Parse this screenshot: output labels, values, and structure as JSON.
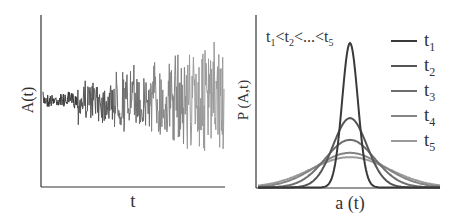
{
  "chart_data": [
    {
      "type": "line",
      "title": "",
      "xlabel": "t",
      "ylabel": "A(t)",
      "grid": false,
      "description": "Noisy time series whose amplitude grows with t; color lightens from dark gray to light gray over time",
      "segments": [
        {
          "name": "t1",
          "x_range": [
            0,
            0.19
          ],
          "amplitude": 0.1,
          "color": "#3a3a3a"
        },
        {
          "name": "t2",
          "x_range": [
            0.19,
            0.39
          ],
          "amplitude": 0.3,
          "color": "#555555"
        },
        {
          "name": "t3",
          "x_range": [
            0.39,
            0.59
          ],
          "amplitude": 0.45,
          "color": "#6e6e6e"
        },
        {
          "name": "t4",
          "x_range": [
            0.59,
            0.79
          ],
          "amplitude": 0.6,
          "color": "#858585"
        },
        {
          "name": "t5",
          "x_range": [
            0.79,
            1.0
          ],
          "amplitude": 0.75,
          "color": "#9a9a9a"
        }
      ]
    },
    {
      "type": "line",
      "title": "",
      "annotation": "t1<t2<...<t5",
      "xlabel": "a (t)",
      "ylabel": "P (A,t)",
      "grid": false,
      "legend_position": "right",
      "series": [
        {
          "name": "t1",
          "peak": 1.0,
          "width": 0.06,
          "color": "#3a3a3a"
        },
        {
          "name": "t2",
          "peak": 0.48,
          "width": 0.13,
          "color": "#555555"
        },
        {
          "name": "t3",
          "peak": 0.33,
          "width": 0.19,
          "color": "#6e6e6e"
        },
        {
          "name": "t4",
          "peak": 0.24,
          "width": 0.26,
          "color": "#858585"
        },
        {
          "name": "t5",
          "peak": 0.21,
          "width": 0.3,
          "color": "#9a9a9a"
        }
      ]
    }
  ],
  "left": {
    "xlabel": "t",
    "ylabel": "A(t)"
  },
  "right": {
    "xlabel": "a (t)",
    "ylabel": "P (A,t)",
    "annotation": {
      "t1": "t",
      "s1": "1",
      "lt1": "<",
      "t2": "t",
      "s2": "2",
      "lt2": "<...<",
      "t5": "t",
      "s5": "5"
    },
    "legend": [
      {
        "t": "t",
        "sub": "1"
      },
      {
        "t": "t",
        "sub": "2"
      },
      {
        "t": "t",
        "sub": "3"
      },
      {
        "t": "t",
        "sub": "4"
      },
      {
        "t": "t",
        "sub": "5"
      }
    ]
  }
}
